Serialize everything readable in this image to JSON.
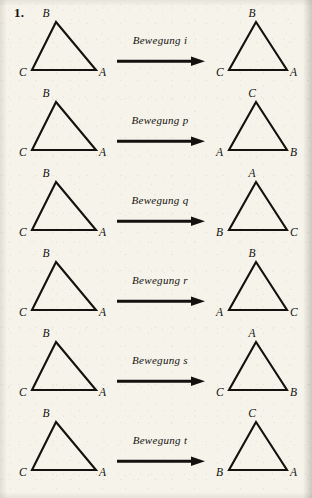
{
  "problem": {
    "number": "1."
  },
  "colors": {
    "ink": "#14120f",
    "paper": "#f5f3ea"
  },
  "rows": [
    {
      "id": "row-i",
      "source": {
        "apex": "B",
        "bottom_left": "C",
        "bottom_right": "A"
      },
      "operation": {
        "label": "Bewegung i",
        "name": "i"
      },
      "result": {
        "apex": "B",
        "bottom_left": "C",
        "bottom_right": "A"
      }
    },
    {
      "id": "row-p",
      "source": {
        "apex": "B",
        "bottom_left": "C",
        "bottom_right": "A"
      },
      "operation": {
        "label": "Bewegung p",
        "name": "p"
      },
      "result": {
        "apex": "C",
        "bottom_left": "A",
        "bottom_right": "B"
      }
    },
    {
      "id": "row-q",
      "source": {
        "apex": "B",
        "bottom_left": "C",
        "bottom_right": "A"
      },
      "operation": {
        "label": "Bewegung q",
        "name": "q"
      },
      "result": {
        "apex": "A",
        "bottom_left": "B",
        "bottom_right": "C"
      }
    },
    {
      "id": "row-r",
      "source": {
        "apex": "B",
        "bottom_left": "C",
        "bottom_right": "A"
      },
      "operation": {
        "label": "Bewegung r",
        "name": "r"
      },
      "result": {
        "apex": "B",
        "bottom_left": "A",
        "bottom_right": "C"
      }
    },
    {
      "id": "row-s",
      "source": {
        "apex": "B",
        "bottom_left": "C",
        "bottom_right": "A"
      },
      "operation": {
        "label": "Bewegung s",
        "name": "s"
      },
      "result": {
        "apex": "A",
        "bottom_left": "C",
        "bottom_right": "B"
      }
    },
    {
      "id": "row-t",
      "source": {
        "apex": "B",
        "bottom_left": "C",
        "bottom_right": "A"
      },
      "operation": {
        "label": "Bewegung t",
        "name": "t"
      },
      "result": {
        "apex": "C",
        "bottom_left": "B",
        "bottom_right": "A"
      }
    }
  ]
}
